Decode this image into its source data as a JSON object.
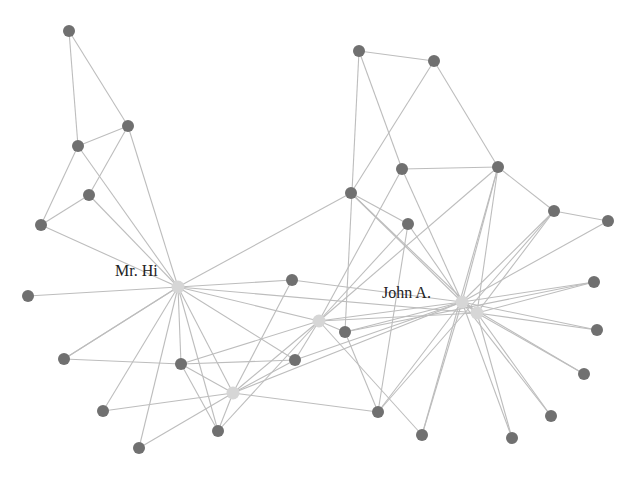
{
  "diagram": {
    "type": "network-graph",
    "title": "",
    "labels": {
      "mr_hi": "Mr. Hi",
      "john_a": "John A."
    },
    "colors": {
      "edge": "#bdbdbd",
      "node_dark": "#707070",
      "node_light": "#d6d6d6",
      "label": "#222222",
      "background": "#ffffff"
    },
    "nodes": [
      {
        "id": "A",
        "x": 69,
        "y": 31,
        "kind": "dark"
      },
      {
        "id": "B",
        "x": 128,
        "y": 126,
        "kind": "dark"
      },
      {
        "id": "C",
        "x": 78,
        "y": 146,
        "kind": "dark"
      },
      {
        "id": "D",
        "x": 89,
        "y": 195,
        "kind": "dark"
      },
      {
        "id": "E",
        "x": 41,
        "y": 225,
        "kind": "dark"
      },
      {
        "id": "MrHi",
        "x": 178,
        "y": 287,
        "kind": "light",
        "label": "Mr. Hi"
      },
      {
        "id": "F",
        "x": 28,
        "y": 296,
        "kind": "dark"
      },
      {
        "id": "G",
        "x": 292,
        "y": 280,
        "kind": "dark"
      },
      {
        "id": "H",
        "x": 64,
        "y": 359,
        "kind": "dark"
      },
      {
        "id": "I",
        "x": 181,
        "y": 364,
        "kind": "dark"
      },
      {
        "id": "J",
        "x": 295,
        "y": 360,
        "kind": "dark"
      },
      {
        "id": "K",
        "x": 233,
        "y": 393,
        "kind": "light"
      },
      {
        "id": "L",
        "x": 103,
        "y": 411,
        "kind": "dark"
      },
      {
        "id": "M",
        "x": 218,
        "y": 431,
        "kind": "dark"
      },
      {
        "id": "N",
        "x": 139,
        "y": 448,
        "kind": "dark"
      },
      {
        "id": "O",
        "x": 319,
        "y": 321,
        "kind": "light"
      },
      {
        "id": "P",
        "x": 345,
        "y": 332,
        "kind": "dark"
      },
      {
        "id": "Q",
        "x": 378,
        "y": 412,
        "kind": "dark"
      },
      {
        "id": "R",
        "x": 422,
        "y": 435,
        "kind": "dark"
      },
      {
        "id": "S",
        "x": 359,
        "y": 51,
        "kind": "dark"
      },
      {
        "id": "T",
        "x": 434,
        "y": 61,
        "kind": "dark"
      },
      {
        "id": "U",
        "x": 351,
        "y": 193,
        "kind": "dark"
      },
      {
        "id": "V",
        "x": 402,
        "y": 169,
        "kind": "dark"
      },
      {
        "id": "W",
        "x": 498,
        "y": 167,
        "kind": "dark"
      },
      {
        "id": "X",
        "x": 408,
        "y": 224,
        "kind": "dark"
      },
      {
        "id": "Y",
        "x": 554,
        "y": 211,
        "kind": "dark"
      },
      {
        "id": "Z",
        "x": 608,
        "y": 221,
        "kind": "dark"
      },
      {
        "id": "JohnA",
        "x": 462,
        "y": 302,
        "kind": "light",
        "label": "John A."
      },
      {
        "id": "JA2",
        "x": 477,
        "y": 313,
        "kind": "light"
      },
      {
        "id": "AA",
        "x": 594,
        "y": 282,
        "kind": "dark"
      },
      {
        "id": "AB",
        "x": 597,
        "y": 330,
        "kind": "dark"
      },
      {
        "id": "AC",
        "x": 584,
        "y": 374,
        "kind": "dark"
      },
      {
        "id": "AD",
        "x": 551,
        "y": 416,
        "kind": "dark"
      },
      {
        "id": "AE",
        "x": 512,
        "y": 438,
        "kind": "dark"
      }
    ],
    "edges": [
      [
        "A",
        "C"
      ],
      [
        "A",
        "B"
      ],
      [
        "C",
        "B"
      ],
      [
        "C",
        "E"
      ],
      [
        "C",
        "MrHi"
      ],
      [
        "B",
        "D"
      ],
      [
        "B",
        "MrHi"
      ],
      [
        "D",
        "E"
      ],
      [
        "D",
        "MrHi"
      ],
      [
        "E",
        "MrHi"
      ],
      [
        "F",
        "MrHi"
      ],
      [
        "MrHi",
        "G"
      ],
      [
        "MrHi",
        "U"
      ],
      [
        "MrHi",
        "O"
      ],
      [
        "MrHi",
        "JA2"
      ],
      [
        "MrHi",
        "H"
      ],
      [
        "MrHi",
        "I"
      ],
      [
        "MrHi",
        "J"
      ],
      [
        "MrHi",
        "K"
      ],
      [
        "MrHi",
        "L"
      ],
      [
        "MrHi",
        "M"
      ],
      [
        "MrHi",
        "N"
      ],
      [
        "G",
        "JohnA"
      ],
      [
        "G",
        "K"
      ],
      [
        "H",
        "I"
      ],
      [
        "H",
        "MrHi"
      ],
      [
        "I",
        "J"
      ],
      [
        "I",
        "K"
      ],
      [
        "I",
        "M"
      ],
      [
        "I",
        "O"
      ],
      [
        "J",
        "K"
      ],
      [
        "J",
        "O"
      ],
      [
        "J",
        "JohnA"
      ],
      [
        "K",
        "L"
      ],
      [
        "K",
        "M"
      ],
      [
        "K",
        "O"
      ],
      [
        "K",
        "N"
      ],
      [
        "K",
        "JohnA"
      ],
      [
        "K",
        "Q"
      ],
      [
        "M",
        "O"
      ],
      [
        "O",
        "P"
      ],
      [
        "O",
        "JohnA"
      ],
      [
        "O",
        "JA2"
      ],
      [
        "O",
        "R"
      ],
      [
        "O",
        "X"
      ],
      [
        "O",
        "V"
      ],
      [
        "O",
        "W"
      ],
      [
        "P",
        "JohnA"
      ],
      [
        "P",
        "Q"
      ],
      [
        "P",
        "AA"
      ],
      [
        "Q",
        "JohnA"
      ],
      [
        "Q",
        "X"
      ],
      [
        "Q",
        "Y"
      ],
      [
        "R",
        "JohnA"
      ],
      [
        "R",
        "W"
      ],
      [
        "S",
        "T"
      ],
      [
        "S",
        "P"
      ],
      [
        "S",
        "V"
      ],
      [
        "T",
        "U"
      ],
      [
        "T",
        "W"
      ],
      [
        "U",
        "X"
      ],
      [
        "U",
        "JohnA"
      ],
      [
        "U",
        "JA2"
      ],
      [
        "V",
        "W"
      ],
      [
        "V",
        "JohnA"
      ],
      [
        "W",
        "Y"
      ],
      [
        "W",
        "JohnA"
      ],
      [
        "W",
        "JA2"
      ],
      [
        "X",
        "JohnA"
      ],
      [
        "Y",
        "Z"
      ],
      [
        "Y",
        "JohnA"
      ],
      [
        "Y",
        "JA2"
      ],
      [
        "Z",
        "JohnA"
      ],
      [
        "JohnA",
        "JA2"
      ],
      [
        "JohnA",
        "AA"
      ],
      [
        "JohnA",
        "AB"
      ],
      [
        "JohnA",
        "AC"
      ],
      [
        "JohnA",
        "AD"
      ],
      [
        "JohnA",
        "AE"
      ],
      [
        "JA2",
        "AA"
      ],
      [
        "JA2",
        "AB"
      ],
      [
        "JA2",
        "AC"
      ],
      [
        "JA2",
        "AD"
      ],
      [
        "JA2",
        "AE"
      ]
    ]
  }
}
